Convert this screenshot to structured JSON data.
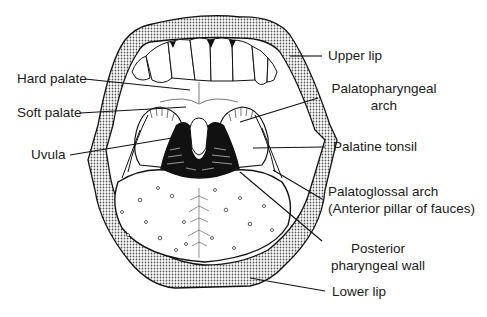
{
  "diagram": {
    "colors": {
      "ink": "#111111",
      "background": "#ffffff",
      "stipple": "#555555"
    },
    "labels": {
      "hard_palate": "Hard palate",
      "soft_palate": "Soft palate",
      "uvula": "Uvula",
      "upper_lip": "Upper lip",
      "palatopharyngeal_arch_line1": "Palatopharyngeal",
      "palatopharyngeal_arch_line2": "arch",
      "palatine_tonsil": "Palatine tonsil",
      "palatoglossal_arch_line1": "Palatoglossal arch",
      "palatoglossal_arch_line2": "(Anterior pillar of fauces)",
      "posterior_pharyngeal_wall_line1": "Posterior",
      "posterior_pharyngeal_wall_line2": "pharyngeal wall",
      "lower_lip": "Lower lip"
    }
  }
}
